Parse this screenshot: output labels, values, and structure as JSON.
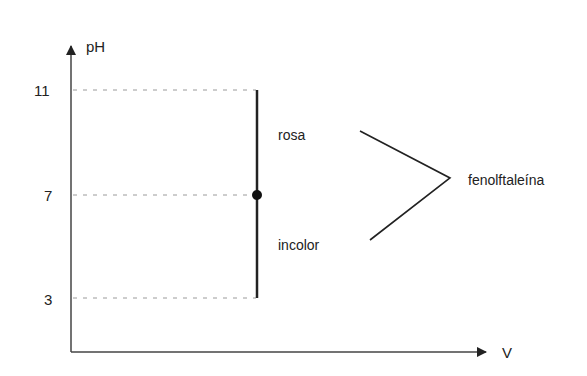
{
  "diagram": {
    "y_axis": {
      "label": "pH"
    },
    "x_axis": {
      "label": "V"
    },
    "ticks": [
      {
        "value": "11",
        "y": 90
      },
      {
        "value": "7",
        "y": 195
      },
      {
        "value": "3",
        "y": 298
      }
    ],
    "indicator": {
      "name": "fenolftaleína",
      "upper_color": "rosa",
      "lower_color": "incolor",
      "transition_ph": 7,
      "range_min_ph": 3,
      "range_max_ph": 11
    },
    "colors": {
      "line": "#222222",
      "dashed": "#9a9a9a"
    }
  }
}
